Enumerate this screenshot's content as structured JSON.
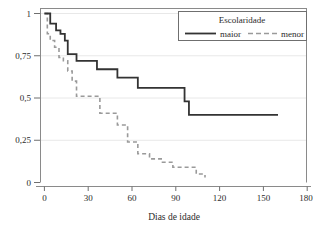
{
  "chart_data": {
    "type": "line",
    "title": "",
    "subtitle": "",
    "xlabel": "Dias de idade",
    "ylabel": "",
    "xlim": [
      0,
      180
    ],
    "ylim": [
      0,
      1
    ],
    "grid": true,
    "grid_axis": "y",
    "legend_position": "top-right",
    "legend_title": "Escolaridade",
    "xticks": [
      0,
      30,
      60,
      90,
      120,
      150,
      180
    ],
    "xtick_labels": [
      "0",
      "30",
      "60",
      "90",
      "120",
      "150",
      "180"
    ],
    "yticks": [
      0,
      0.25,
      0.5,
      0.75,
      1
    ],
    "ytick_labels": [
      "0",
      "0,25",
      "0,5",
      "0,75",
      "1"
    ],
    "series": [
      {
        "name": "maior",
        "style": "solid",
        "color": "#333333",
        "x": [
          0,
          2,
          4,
          6,
          8,
          11,
          14,
          16,
          18,
          22,
          30,
          36,
          44,
          50,
          57,
          64,
          72,
          93,
          96,
          99,
          160
        ],
        "y": [
          1.0,
          1.0,
          0.94,
          0.94,
          0.9,
          0.88,
          0.84,
          0.76,
          0.76,
          0.72,
          0.72,
          0.67,
          0.67,
          0.62,
          0.62,
          0.56,
          0.56,
          0.56,
          0.48,
          0.4,
          0.4
        ],
        "values": [
          1.0,
          1.0,
          0.94,
          0.94,
          0.9,
          0.88,
          0.84,
          0.76,
          0.76,
          0.72,
          0.72,
          0.67,
          0.67,
          0.62,
          0.62,
          0.56,
          0.56,
          0.56,
          0.48,
          0.4,
          0.4
        ]
      },
      {
        "name": "menor",
        "style": "dashed",
        "color": "#9a9a9a",
        "x": [
          0,
          2,
          4,
          7,
          10,
          13,
          16,
          19,
          22,
          36,
          38,
          44,
          50,
          53,
          57,
          64,
          72,
          80,
          88,
          96,
          104,
          110
        ],
        "y": [
          1.0,
          0.88,
          0.84,
          0.8,
          0.74,
          0.72,
          0.66,
          0.6,
          0.51,
          0.51,
          0.41,
          0.41,
          0.34,
          0.34,
          0.24,
          0.17,
          0.14,
          0.12,
          0.09,
          0.09,
          0.05,
          0.03
        ],
        "values": [
          1.0,
          0.88,
          0.84,
          0.8,
          0.74,
          0.72,
          0.66,
          0.6,
          0.51,
          0.51,
          0.41,
          0.41,
          0.34,
          0.34,
          0.24,
          0.17,
          0.14,
          0.12,
          0.09,
          0.09,
          0.05,
          0.03
        ]
      }
    ]
  },
  "legend": {
    "title": "Escolaridade",
    "entries": [
      {
        "label": "maior",
        "style": "solid"
      },
      {
        "label": "menor",
        "style": "dashed"
      }
    ]
  },
  "axes": {
    "x_title": "Dias de idade",
    "x_labels": [
      "0",
      "30",
      "60",
      "90",
      "120",
      "150",
      "180"
    ],
    "y_labels": [
      "1",
      "0,75",
      "0,5",
      "0,25",
      "0"
    ]
  },
  "colors": {
    "series_maior": "#333333",
    "series_menor": "#9a9a9a",
    "frame": "#8a8a8a",
    "grid": "#e6e6e6",
    "text": "#2b2b2b",
    "background": "#ffffff"
  }
}
